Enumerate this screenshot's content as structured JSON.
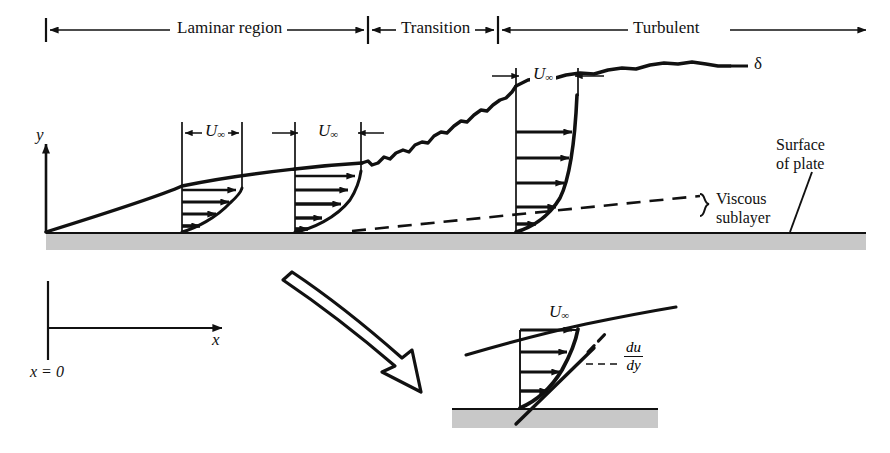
{
  "figure": {
    "colors": {
      "ink": "#111111",
      "plate_fill": "#c8c8c8",
      "plate_edge": "#111111",
      "background": "#ffffff"
    }
  },
  "regions": {
    "laminar": {
      "label": "Laminar region",
      "start_x": 46,
      "end_x": 368
    },
    "transition": {
      "label": "Transition",
      "start_x": 368,
      "end_x": 498
    },
    "turbulent": {
      "label": "Turbulent",
      "start_x": 498,
      "end_x": 866
    }
  },
  "axes": {
    "y_label": "y",
    "x_label": "x",
    "origin_label": "x = 0"
  },
  "annotations": {
    "delta": "δ",
    "surface_of_plate_line1": "Surface",
    "surface_of_plate_line2": "of plate",
    "viscous_sublayer_line1": "Viscous",
    "viscous_sublayer_line2": "sublayer",
    "free_stream_symbol": "U",
    "free_stream_subscript": "∞",
    "gradient_numerator": "du",
    "gradient_denominator": "dy"
  },
  "velocity_profiles": [
    {
      "name": "laminar-profile-1",
      "station_x": 182,
      "top_y": 186,
      "width": 60,
      "type": "laminar",
      "arrow_count": 4
    },
    {
      "name": "laminar-profile-2",
      "station_x": 295,
      "top_y": 170,
      "width": 66,
      "type": "laminar",
      "arrow_count": 4
    },
    {
      "name": "turbulent-profile",
      "station_x": 516,
      "top_y": 84,
      "width": 62,
      "type": "turbulent",
      "arrow_count": 5
    }
  ],
  "inset": {
    "name": "magnified-turbulent-profile",
    "station_x": 520,
    "top_y": 330,
    "plate_y": 409,
    "width": 62,
    "arrow_count": 4,
    "gradient_label": "du/dy"
  },
  "plate": {
    "main_top_y": 233,
    "main_bottom_y": 250,
    "inset_top_y": 409,
    "inset_bottom_y": 428
  }
}
